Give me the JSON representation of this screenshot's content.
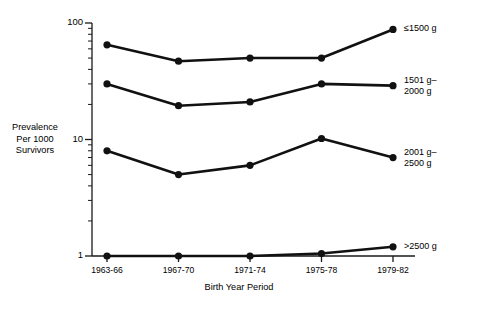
{
  "chart_data": {
    "type": "line",
    "title": "",
    "xlabel": "Birth Year Period",
    "ylabel": "Prevalence\nPer 1000\nSurvivors",
    "yscale": "log",
    "ylim": [
      1,
      100
    ],
    "ytick_labels": [
      "100",
      "10",
      "1"
    ],
    "ytick_values": [
      100,
      10,
      1
    ],
    "grid": false,
    "legend_position": "right-inline",
    "categories": [
      "1963-66",
      "1967-70",
      "1971-74",
      "1975-78",
      "1979-82"
    ],
    "series": [
      {
        "name": "≤1500 g",
        "label_lines": [
          "≤1500 g"
        ],
        "values": [
          65,
          47,
          50,
          50,
          88
        ]
      },
      {
        "name": "1501 g–2000 g",
        "label_lines": [
          "1501 g–",
          "2000 g"
        ],
        "values": [
          30,
          19.5,
          21,
          30,
          29
        ]
      },
      {
        "name": "2001 g–2500 g",
        "label_lines": [
          "2001 g–",
          "2500 g"
        ],
        "values": [
          8,
          5,
          6,
          10.2,
          7
        ]
      },
      {
        "name": ">2500 g",
        "label_lines": [
          ">2500 g"
        ],
        "values": [
          1.0,
          1.0,
          1.0,
          1.05,
          1.2
        ]
      }
    ]
  },
  "axis": {
    "y_title_line1": "Prevalence",
    "y_title_line2": "Per 1000",
    "y_title_line3": "Survivors",
    "x_title": "Birth Year Period",
    "ytick_100": "100",
    "ytick_10": "10",
    "ytick_1": "1",
    "xtick_0": "1963-66",
    "xtick_1": "1967-70",
    "xtick_2": "1971-74",
    "xtick_3": "1975-78",
    "xtick_4": "1979-82"
  },
  "series_labels": {
    "s0_l1": "≤1500 g",
    "s1_l1": "1501 g–",
    "s1_l2": "2000 g",
    "s2_l1": "2001 g–",
    "s2_l2": "2500 g",
    "s3_l1": ">2500 g"
  },
  "colors": {
    "ink": "#111111",
    "background": "#ffffff"
  }
}
